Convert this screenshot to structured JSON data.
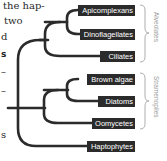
{
  "text_fragments": [
    {
      "text": "the hap-",
      "x": 3,
      "y": 0
    },
    {
      "text": "two",
      "x": 4,
      "y": 15
    },
    {
      "text": "d",
      "x": 1,
      "y": 31
    },
    {
      "text": "s",
      "x": 1,
      "y": 48,
      "bold": true
    },
    {
      "text": "–",
      "x": 1,
      "y": 66
    },
    {
      "text": "–",
      "x": 1,
      "y": 85
    },
    {
      "text": "s",
      "x": 1,
      "y": 129
    }
  ],
  "tree": {
    "taxa": [
      {
        "name": "Apicomplexans",
        "y": 10,
        "box_x": 78
      },
      {
        "name": "Dinoflagellates",
        "y": 34,
        "box_x": 80
      },
      {
        "name": "Ciliates",
        "y": 56,
        "box_x": 100
      },
      {
        "name": "Brown algae",
        "y": 79,
        "box_x": 87
      },
      {
        "name": "Diatoms",
        "y": 101,
        "box_x": 98
      },
      {
        "name": "Oomycetes",
        "y": 123,
        "box_x": 92
      },
      {
        "name": "Haptophytes",
        "y": 146,
        "box_x": 87
      }
    ],
    "groups": [
      {
        "name": "Alveolates",
        "y_top": 5,
        "y_bottom": 62
      },
      {
        "name": "Stramenopiles",
        "y_top": 73,
        "y_bottom": 129
      }
    ],
    "line_color": "#2b2b2b",
    "label_bg": "#2b2b2b",
    "label_text_color": "#ffffff",
    "bracket_color": "#9a9a9a"
  }
}
